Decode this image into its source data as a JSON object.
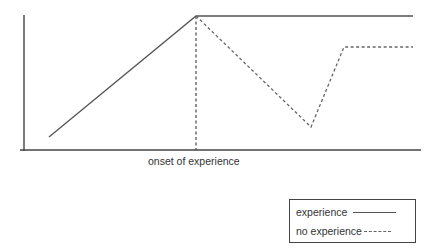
{
  "diagram": {
    "type": "line",
    "title": "",
    "xlabel": "onset of experience",
    "ylabel": "",
    "axes": {
      "y_axis": {
        "x": 24,
        "y1": 15,
        "y2": 151
      },
      "x_axis": {
        "y": 150,
        "x1": 20,
        "x2": 421
      }
    },
    "onset_marker": {
      "x": 196,
      "y1": 16,
      "y2": 150,
      "style": "dashed"
    },
    "colors": {
      "line": "#555555",
      "axis": "#444444",
      "background": "#ffffff"
    }
  },
  "chart_data": {
    "type": "line",
    "title": "",
    "xlabel": "onset of experience",
    "ylabel": "",
    "grid": false,
    "legend_position": "bottom-right",
    "series": [
      {
        "name": "experience",
        "style": "solid",
        "points": [
          [
            49,
            137
          ],
          [
            196,
            16
          ],
          [
            413,
            16
          ]
        ]
      },
      {
        "name": "no experience",
        "style": "dashed",
        "points": [
          [
            196,
            16
          ],
          [
            311,
            127
          ],
          [
            344,
            47
          ],
          [
            413,
            47
          ]
        ]
      }
    ]
  },
  "legend": {
    "items": [
      {
        "label": "experience",
        "style": "solid"
      },
      {
        "label": "no experience",
        "style": "dashed"
      }
    ]
  }
}
